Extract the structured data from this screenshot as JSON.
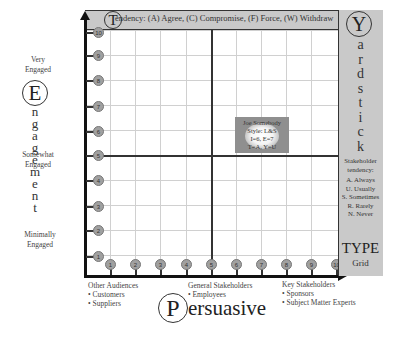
{
  "header": {
    "initial": "T",
    "text": "endency: (A) Agree, (C) Compromise, (F) Force, (W) Withdraw"
  },
  "right_panel": {
    "initial": "Y",
    "letters": [
      "a",
      "r",
      "d",
      "s",
      "t",
      "i",
      "c",
      "k"
    ],
    "tendency_title_line1": "Stakeholder",
    "tendency_title_line2": "tendency:",
    "tendency_items": [
      "A. Always",
      "U. Usually",
      "S. Sometimes",
      "R. Rarely",
      "N. Never"
    ],
    "type_label": "TYPE",
    "grid_label": "Grid"
  },
  "y_axis": {
    "initial": "E",
    "letters": [
      "n",
      "g",
      "a",
      "g",
      "e",
      "m",
      "e",
      "n",
      "t"
    ],
    "ticks": [
      "10",
      "9",
      "8",
      "7",
      "6",
      "5",
      "4",
      "3",
      "2",
      "1"
    ],
    "levels": [
      {
        "line1": "Very",
        "line2": "Engaged"
      },
      {
        "line1": "Somewhat",
        "line2": "Engaged"
      },
      {
        "line1": "Minimally",
        "line2": "Engaged"
      }
    ]
  },
  "x_axis": {
    "initial": "P",
    "rest": "ersuasive",
    "ticks": [
      "1",
      "2",
      "3",
      "4",
      "5",
      "6",
      "7",
      "8",
      "9",
      "10"
    ],
    "groups": [
      {
        "title": "Other Audiences",
        "items": [
          "• Customers",
          "• Suppliers"
        ]
      },
      {
        "title": "General Stakeholders",
        "items": [
          "• Employees"
        ]
      },
      {
        "title": "Key Stakeholders",
        "items": [
          "• Sponsors",
          "• Subject Matter Experts"
        ]
      }
    ]
  },
  "marker": {
    "name": "Joe Somebody",
    "style": "Style: L&S",
    "scores": "I=6, E=7",
    "types": "T=A, Y=U"
  },
  "colors": {
    "panel_gray": "#c9c9c9",
    "marker_gray": "#8f8f8f",
    "axis": "#111111",
    "gridline": "#d0d0d0"
  }
}
